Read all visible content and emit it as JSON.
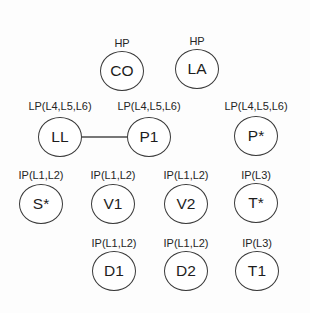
{
  "diagram": {
    "title": "",
    "type": "node-graph",
    "background_color": "#fdfdfd",
    "node_stroke_color": "#3a3a3a",
    "node_fill_color": "#ffffff",
    "edge_color": "#4a4a4a",
    "nodes": [
      {
        "id": "CO",
        "label": "CO",
        "tag": "HP",
        "cx": 122,
        "cy": 71,
        "tag_y": 38
      },
      {
        "id": "LA",
        "label": "LA",
        "tag": "HP",
        "cx": 197,
        "cy": 69,
        "tag_y": 36
      },
      {
        "id": "LL",
        "label": "LL",
        "tag": "LP(L4,L5,L6)",
        "cx": 60,
        "cy": 137,
        "tag_y": 101
      },
      {
        "id": "P1",
        "label": "P1",
        "tag": "LP(L4,L5,L6)",
        "cx": 149,
        "cy": 137,
        "tag_y": 101
      },
      {
        "id": "PS",
        "label": "P*",
        "tag": "LP(L4,L5,L6)",
        "cx": 256,
        "cy": 136,
        "tag_y": 101
      },
      {
        "id": "SS",
        "label": "S*",
        "tag": "IP(L1,L2)",
        "cx": 41,
        "cy": 204,
        "tag_y": 170
      },
      {
        "id": "V1",
        "label": "V1",
        "tag": "IP(L1,L2)",
        "cx": 113,
        "cy": 204,
        "tag_y": 170
      },
      {
        "id": "V2",
        "label": "V2",
        "tag": "IP(L1,L2)",
        "cx": 186,
        "cy": 204,
        "tag_y": 170
      },
      {
        "id": "TS",
        "label": "T*",
        "tag": "IP(L3)",
        "cx": 256,
        "cy": 203,
        "tag_y": 170
      },
      {
        "id": "D1",
        "label": "D1",
        "tag": "IP(L1,L2)",
        "cx": 114,
        "cy": 271,
        "tag_y": 238
      },
      {
        "id": "D2",
        "label": "D2",
        "tag": "IP(L1,L2)",
        "cx": 186,
        "cy": 271,
        "tag_y": 238
      },
      {
        "id": "T1",
        "label": "T1",
        "tag": "IP(L3)",
        "cx": 257,
        "cy": 271,
        "tag_y": 238
      }
    ],
    "edges": [
      {
        "from": "LL",
        "to": "P1",
        "x1": 82,
        "y1": 137,
        "x2": 127,
        "y2": 137
      }
    ]
  }
}
